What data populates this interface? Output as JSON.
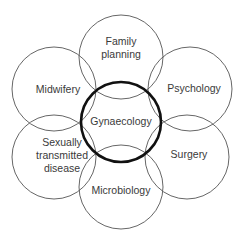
{
  "diagram": {
    "center": {
      "label": "Gynaecology",
      "cx": 121,
      "cy": 122,
      "r": 40
    },
    "petals": [
      {
        "id": "family-planning",
        "lines": [
          "Family",
          "planning"
        ],
        "cx": 121,
        "cy": 57,
        "r": 42
      },
      {
        "id": "psychology",
        "lines": [
          "Psychology"
        ],
        "cx": 190,
        "cy": 89,
        "r": 42
      },
      {
        "id": "surgery",
        "lines": [
          "Surgery"
        ],
        "cx": 187,
        "cy": 157,
        "r": 42
      },
      {
        "id": "microbiology",
        "lines": [
          "Microbiology"
        ],
        "cx": 121,
        "cy": 187,
        "r": 42
      },
      {
        "id": "sexually-transmitted-disease",
        "lines": [
          "Sexually",
          "transmitted",
          "disease"
        ],
        "cx": 54,
        "cy": 157,
        "r": 42
      },
      {
        "id": "midwifery",
        "lines": [
          "Midwifery"
        ],
        "cx": 54,
        "cy": 89,
        "r": 42
      }
    ],
    "label_positions": {
      "family-planning": {
        "x": 121,
        "y": [
          45,
          58
        ]
      },
      "psychology": {
        "x": 194,
        "y": [
          92
        ]
      },
      "surgery": {
        "x": 189,
        "y": [
          158
        ]
      },
      "microbiology": {
        "x": 121,
        "y": [
          194
        ]
      },
      "sexually-transmitted-disease": {
        "x": 62,
        "y": [
          146,
          159,
          172
        ]
      },
      "midwifery": {
        "x": 58,
        "y": [
          93
        ]
      },
      "center": {
        "x": 121,
        "y": 125
      }
    },
    "colors": {
      "petal_stroke": "#555555",
      "hub_stroke": "#111111",
      "text": "#3a3a3a",
      "background": "#ffffff"
    }
  }
}
